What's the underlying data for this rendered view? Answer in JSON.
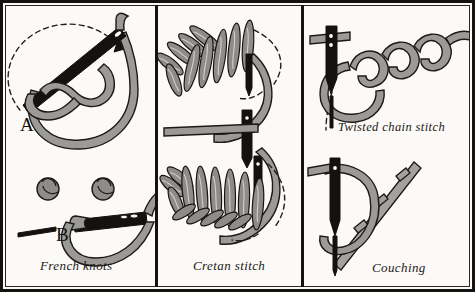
{
  "plate": {
    "title": "Embroidery stitches instructional plate",
    "background_color": "#fbfaf8",
    "frame_color": "#15130f",
    "thread_color": "#9b9a96",
    "needle_color": "#141210",
    "outline_color": "#1c1a17"
  },
  "panels": [
    {
      "id": "french-knots",
      "caption": "French knots",
      "step_markers": [
        "A",
        "B"
      ],
      "elements": [
        "dashed-direction-arc",
        "direction-arrowhead",
        "needle-with-eye",
        "wrapped-thread-loop",
        "finished-knot-1",
        "finished-knot-2",
        "short-stitch-mark"
      ]
    },
    {
      "id": "cretan-stitch",
      "caption": "Cretan stitch",
      "step_markers": [
        "A",
        "B"
      ],
      "elements": [
        "feathered-stitch-row-a",
        "feathered-stitch-row-b",
        "needle-upper",
        "needle-lower",
        "working-thread",
        "dashed-guide-line"
      ]
    },
    {
      "id": "twisted-chain-stitch",
      "caption": "Twisted chain stitch",
      "step_markers": [],
      "elements": [
        "needle-vertical",
        "twisted-loop-chain",
        "working-loop",
        "dashed-guide-line"
      ]
    },
    {
      "id": "couching",
      "caption": "Couching",
      "step_markers": [],
      "elements": [
        "needle-vertical",
        "laid-thread",
        "binding-stitches",
        "working-loop"
      ]
    }
  ]
}
